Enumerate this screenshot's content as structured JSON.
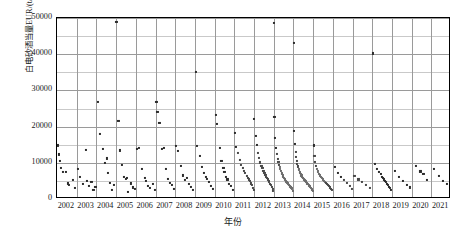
{
  "chart_data": {
    "type": "scatter",
    "title": "",
    "xlabel": "年份",
    "ylabel": "白电砂酒当量EUR/(t/1000t)",
    "ylim": [
      0,
      50000
    ],
    "yticks": [
      0,
      10000,
      20000,
      30000,
      40000,
      50000
    ],
    "ytick_labels": [
      "0",
      "10000",
      "20000",
      "30000",
      "40000",
      "50000"
    ],
    "y_minor_step": 5000,
    "grid": true,
    "legend": "none",
    "categories": [
      "2002",
      "2003",
      "2004",
      "2005",
      "2006",
      "2007",
      "2008",
      "2009",
      "2010",
      "2011",
      "2012",
      "2013",
      "2014",
      "2015",
      "2016",
      "2017",
      "2018",
      "2019",
      "2020",
      "2021"
    ],
    "marker": "square",
    "marker_color": "#2b2b2b",
    "points": [
      [
        2002.05,
        14800
      ],
      [
        2002.1,
        12300
      ],
      [
        2002.15,
        10400
      ],
      [
        2002.2,
        8600
      ],
      [
        2002.3,
        7400
      ],
      [
        2002.45,
        7500
      ],
      [
        2002.55,
        4300
      ],
      [
        2002.62,
        3900
      ],
      [
        2002.8,
        5200
      ],
      [
        2002.9,
        3100
      ],
      [
        2003.05,
        8200
      ],
      [
        2003.15,
        6200
      ],
      [
        2003.3,
        4100
      ],
      [
        2003.45,
        13500
      ],
      [
        2003.5,
        5100
      ],
      [
        2003.6,
        3500
      ],
      [
        2003.75,
        4700
      ],
      [
        2003.85,
        2600
      ],
      [
        2003.95,
        3300
      ],
      [
        2004.1,
        26800
      ],
      [
        2004.2,
        17900
      ],
      [
        2004.35,
        13900
      ],
      [
        2004.45,
        9900
      ],
      [
        2004.55,
        11200
      ],
      [
        2004.6,
        7200
      ],
      [
        2004.7,
        4500
      ],
      [
        2004.8,
        2500
      ],
      [
        2004.9,
        3800
      ],
      [
        2005.02,
        48900
      ],
      [
        2005.12,
        21600
      ],
      [
        2005.2,
        13400
      ],
      [
        2005.3,
        9400
      ],
      [
        2005.4,
        6100
      ],
      [
        2005.5,
        5600
      ],
      [
        2005.55,
        5900
      ],
      [
        2005.6,
        1900
      ],
      [
        2005.75,
        4300
      ],
      [
        2005.85,
        3200
      ],
      [
        2005.95,
        2700
      ],
      [
        2006.05,
        13800
      ],
      [
        2006.15,
        14000
      ],
      [
        2006.3,
        8400
      ],
      [
        2006.45,
        5800
      ],
      [
        2006.5,
        4900
      ],
      [
        2006.6,
        3600
      ],
      [
        2006.72,
        3100
      ],
      [
        2006.85,
        4200
      ],
      [
        2006.95,
        2400
      ],
      [
        2007.05,
        26900
      ],
      [
        2007.1,
        24100
      ],
      [
        2007.2,
        21000
      ],
      [
        2007.35,
        13800
      ],
      [
        2007.45,
        14200
      ],
      [
        2007.55,
        8300
      ],
      [
        2007.65,
        5600
      ],
      [
        2007.75,
        4400
      ],
      [
        2007.85,
        3900
      ],
      [
        2007.95,
        2800
      ],
      [
        2008.05,
        14600
      ],
      [
        2008.15,
        13200
      ],
      [
        2008.3,
        9200
      ],
      [
        2008.4,
        6500
      ],
      [
        2008.5,
        5300
      ],
      [
        2008.6,
        5900
      ],
      [
        2008.7,
        4100
      ],
      [
        2008.8,
        3400
      ],
      [
        2008.9,
        2600
      ],
      [
        2009.05,
        35200
      ],
      [
        2009.12,
        14700
      ],
      [
        2009.25,
        11800
      ],
      [
        2009.35,
        8800
      ],
      [
        2009.45,
        7100
      ],
      [
        2009.55,
        6200
      ],
      [
        2009.62,
        5500
      ],
      [
        2009.7,
        4600
      ],
      [
        2009.8,
        3700
      ],
      [
        2009.9,
        2900
      ],
      [
        2010.05,
        23200
      ],
      [
        2010.1,
        20800
      ],
      [
        2010.25,
        14100
      ],
      [
        2010.35,
        10500
      ],
      [
        2010.45,
        8600
      ],
      [
        2010.5,
        7400
      ],
      [
        2010.58,
        6100
      ],
      [
        2010.65,
        5400
      ],
      [
        2010.75,
        4200
      ],
      [
        2010.85,
        3600
      ],
      [
        2010.95,
        2500
      ],
      [
        2011.03,
        18200
      ],
      [
        2011.1,
        14400
      ],
      [
        2011.18,
        12700
      ],
      [
        2011.28,
        10800
      ],
      [
        2011.35,
        9400
      ],
      [
        2011.42,
        8600
      ],
      [
        2011.5,
        7700
      ],
      [
        2011.56,
        7100
      ],
      [
        2011.62,
        6400
      ],
      [
        2011.68,
        5900
      ],
      [
        2011.74,
        5400
      ],
      [
        2011.8,
        4900
      ],
      [
        2011.86,
        4300
      ],
      [
        2011.9,
        3800
      ],
      [
        2011.95,
        3100
      ],
      [
        2011.98,
        2400
      ],
      [
        2012.02,
        22100
      ],
      [
        2012.08,
        17400
      ],
      [
        2012.14,
        14900
      ],
      [
        2012.2,
        12800
      ],
      [
        2012.26,
        11300
      ],
      [
        2012.32,
        10100
      ],
      [
        2012.38,
        9200
      ],
      [
        2012.43,
        8500
      ],
      [
        2012.48,
        7800
      ],
      [
        2012.53,
        7200
      ],
      [
        2012.58,
        6700
      ],
      [
        2012.62,
        6200
      ],
      [
        2012.66,
        5800
      ],
      [
        2012.7,
        5400
      ],
      [
        2012.74,
        5000
      ],
      [
        2012.78,
        4600
      ],
      [
        2012.82,
        4200
      ],
      [
        2012.86,
        3800
      ],
      [
        2012.9,
        3400
      ],
      [
        2012.94,
        2900
      ],
      [
        2012.97,
        2300
      ],
      [
        2013.01,
        48600
      ],
      [
        2013.04,
        22600
      ],
      [
        2013.08,
        16800
      ],
      [
        2013.12,
        14200
      ],
      [
        2013.16,
        12400
      ],
      [
        2013.2,
        11100
      ],
      [
        2013.24,
        10200
      ],
      [
        2013.28,
        9400
      ],
      [
        2013.31,
        8800
      ],
      [
        2013.34,
        8200
      ],
      [
        2013.37,
        7700
      ],
      [
        2013.4,
        7300
      ],
      [
        2013.43,
        6900
      ],
      [
        2013.46,
        6500
      ],
      [
        2013.49,
        6200
      ],
      [
        2013.52,
        5900
      ],
      [
        2013.55,
        5600
      ],
      [
        2013.58,
        5300
      ],
      [
        2013.61,
        5000
      ],
      [
        2013.64,
        4800
      ],
      [
        2013.67,
        4600
      ],
      [
        2013.7,
        4400
      ],
      [
        2013.73,
        4200
      ],
      [
        2013.76,
        4000
      ],
      [
        2013.79,
        3800
      ],
      [
        2013.82,
        3600
      ],
      [
        2013.85,
        3400
      ],
      [
        2013.88,
        3200
      ],
      [
        2013.91,
        3000
      ],
      [
        2013.94,
        2700
      ],
      [
        2013.97,
        2300
      ],
      [
        2014.02,
        43200
      ],
      [
        2014.05,
        18700
      ],
      [
        2014.08,
        15200
      ],
      [
        2014.11,
        13100
      ],
      [
        2014.14,
        11600
      ],
      [
        2014.17,
        10500
      ],
      [
        2014.2,
        9700
      ],
      [
        2014.23,
        9000
      ],
      [
        2014.26,
        8400
      ],
      [
        2014.29,
        7900
      ],
      [
        2014.32,
        7500
      ],
      [
        2014.35,
        7100
      ],
      [
        2014.38,
        6800
      ],
      [
        2014.41,
        6500
      ],
      [
        2014.44,
        6200
      ],
      [
        2014.47,
        5900
      ],
      [
        2014.5,
        5700
      ],
      [
        2014.53,
        5500
      ],
      [
        2014.56,
        5300
      ],
      [
        2014.59,
        5100
      ],
      [
        2014.62,
        4900
      ],
      [
        2014.65,
        4700
      ],
      [
        2014.68,
        4500
      ],
      [
        2014.71,
        4300
      ],
      [
        2014.74,
        4100
      ],
      [
        2014.77,
        3900
      ],
      [
        2014.8,
        3700
      ],
      [
        2014.83,
        3500
      ],
      [
        2014.86,
        3300
      ],
      [
        2014.89,
        3100
      ],
      [
        2014.92,
        2800
      ],
      [
        2014.95,
        2500
      ],
      [
        2014.98,
        2100
      ],
      [
        2015.03,
        14800
      ],
      [
        2015.07,
        11900
      ],
      [
        2015.11,
        10200
      ],
      [
        2015.15,
        9100
      ],
      [
        2015.2,
        8300
      ],
      [
        2015.25,
        7600
      ],
      [
        2015.3,
        7000
      ],
      [
        2015.35,
        6500
      ],
      [
        2015.4,
        6100
      ],
      [
        2015.45,
        5700
      ],
      [
        2015.5,
        5400
      ],
      [
        2015.55,
        5000
      ],
      [
        2015.6,
        4700
      ],
      [
        2015.65,
        4400
      ],
      [
        2015.7,
        4100
      ],
      [
        2015.75,
        3800
      ],
      [
        2015.8,
        3500
      ],
      [
        2015.85,
        3200
      ],
      [
        2015.9,
        2900
      ],
      [
        2015.95,
        2500
      ],
      [
        2016.1,
        8900
      ],
      [
        2016.25,
        7200
      ],
      [
        2016.4,
        6100
      ],
      [
        2016.55,
        5200
      ],
      [
        2016.7,
        4400
      ],
      [
        2016.85,
        3600
      ],
      [
        2016.95,
        2800
      ],
      [
        2017.1,
        6400
      ],
      [
        2017.3,
        5400
      ],
      [
        2017.5,
        4600
      ],
      [
        2017.7,
        3900
      ],
      [
        2017.9,
        3100
      ],
      [
        2018.05,
        40200
      ],
      [
        2018.15,
        9800
      ],
      [
        2018.25,
        8400
      ],
      [
        2018.35,
        7500
      ],
      [
        2018.45,
        6800
      ],
      [
        2018.5,
        6200
      ],
      [
        2018.55,
        5800
      ],
      [
        2018.6,
        5400
      ],
      [
        2018.65,
        5000
      ],
      [
        2018.7,
        4600
      ],
      [
        2018.75,
        4200
      ],
      [
        2018.8,
        3800
      ],
      [
        2018.85,
        3400
      ],
      [
        2018.9,
        3000
      ],
      [
        2018.95,
        2500
      ],
      [
        2019.15,
        7800
      ],
      [
        2019.35,
        6100
      ],
      [
        2019.55,
        5000
      ],
      [
        2019.75,
        4000
      ],
      [
        2019.9,
        3200
      ],
      [
        2020.2,
        9100
      ],
      [
        2020.45,
        7600
      ],
      [
        2020.6,
        6800
      ],
      [
        2020.8,
        5300
      ],
      [
        2021.15,
        8200
      ],
      [
        2021.4,
        6400
      ],
      [
        2021.6,
        5100
      ],
      [
        2021.8,
        4100
      ]
    ]
  },
  "caption": ""
}
